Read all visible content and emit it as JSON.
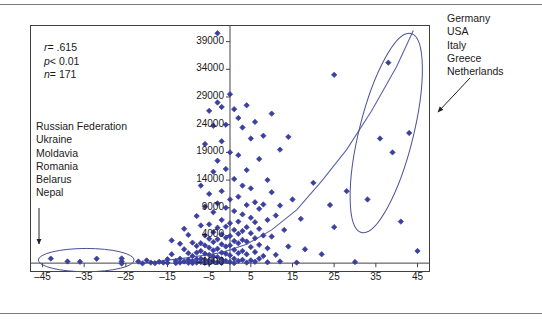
{
  "chart_data": {
    "type": "scatter",
    "title": "",
    "subtitle": "",
    "xlabel": "",
    "ylabel": "",
    "xlim": [
      -48,
      48
    ],
    "ylim": [
      -2600,
      42000
    ],
    "grid": false,
    "legend_position": "none",
    "x_ticks": [
      -45,
      -35,
      -25,
      -15,
      -5,
      5,
      15,
      25,
      35,
      45
    ],
    "y_ticks": [
      -1000,
      4000,
      9000,
      14000,
      19000,
      24000,
      29000,
      34000,
      39000
    ],
    "marker": "diamond",
    "marker_color": "#3b3f9e",
    "fit_line": {
      "type": "exponential-curve",
      "color": "#5a63ae",
      "points": [
        [
          -22,
          -1100
        ],
        [
          -10,
          0
        ],
        [
          -2,
          900
        ],
        [
          4,
          2400
        ],
        [
          10,
          5000
        ],
        [
          16,
          8600
        ],
        [
          22,
          13800
        ],
        [
          28,
          19500
        ],
        [
          34,
          26500
        ],
        [
          40,
          34500
        ],
        [
          44,
          41000
        ]
      ]
    },
    "series": [
      {
        "name": "countries",
        "points": [
          [
            -43,
            -180
          ],
          [
            -39,
            -700
          ],
          [
            -36,
            -760
          ],
          [
            -32,
            -200
          ],
          [
            -26,
            -150
          ],
          [
            -26,
            -680
          ],
          [
            -26,
            -1060
          ],
          [
            -22,
            -700
          ],
          [
            -21,
            -1050
          ],
          [
            -20,
            -500
          ],
          [
            -19,
            -900
          ],
          [
            -18,
            -1000
          ],
          [
            -17,
            -760
          ],
          [
            -16,
            -900
          ],
          [
            -15,
            -950
          ],
          [
            -15,
            -300
          ],
          [
            -14,
            3100
          ],
          [
            -14,
            600
          ],
          [
            -13,
            -600
          ],
          [
            -13,
            -1000
          ],
          [
            -12,
            2500
          ],
          [
            -12,
            -200
          ],
          [
            -12,
            -900
          ],
          [
            -11,
            5200
          ],
          [
            -11,
            1500
          ],
          [
            -11,
            -700
          ],
          [
            -10,
            4100
          ],
          [
            -10,
            800
          ],
          [
            -10,
            -400
          ],
          [
            -10,
            -950
          ],
          [
            -9,
            2700
          ],
          [
            -9,
            300
          ],
          [
            -9,
            -600
          ],
          [
            -9,
            -1000
          ],
          [
            -8,
            7500
          ],
          [
            -8,
            2100
          ],
          [
            -8,
            900
          ],
          [
            -8,
            -300
          ],
          [
            -8,
            -900
          ],
          [
            -7,
            13000
          ],
          [
            -7,
            5800
          ],
          [
            -7,
            2600
          ],
          [
            -7,
            1200
          ],
          [
            -7,
            -200
          ],
          [
            -7,
            -800
          ],
          [
            -6,
            20500
          ],
          [
            -6,
            9200
          ],
          [
            -6,
            4000
          ],
          [
            -6,
            2200
          ],
          [
            -6,
            700
          ],
          [
            -6,
            -400
          ],
          [
            -6,
            -950
          ],
          [
            -5,
            26500
          ],
          [
            -5,
            11500
          ],
          [
            -5,
            6000
          ],
          [
            -5,
            3400
          ],
          [
            -5,
            1800
          ],
          [
            -5,
            500
          ],
          [
            -5,
            -500
          ],
          [
            -5,
            -1000
          ],
          [
            -4,
            23800
          ],
          [
            -4,
            15500
          ],
          [
            -4,
            8200
          ],
          [
            -4,
            4600
          ],
          [
            -4,
            2800
          ],
          [
            -4,
            1300
          ],
          [
            -4,
            200
          ],
          [
            -4,
            -700
          ],
          [
            -3,
            40500
          ],
          [
            -3,
            28000
          ],
          [
            -3,
            17500
          ],
          [
            -3,
            9800
          ],
          [
            -3,
            5400
          ],
          [
            -3,
            3300
          ],
          [
            -3,
            1600
          ],
          [
            -3,
            100
          ],
          [
            -3,
            -850
          ],
          [
            -2,
            27200
          ],
          [
            -2,
            21000
          ],
          [
            -2,
            12000
          ],
          [
            -2,
            6800
          ],
          [
            -2,
            4200
          ],
          [
            -2,
            2400
          ],
          [
            -2,
            900
          ],
          [
            -2,
            -300
          ],
          [
            -2,
            -950
          ],
          [
            -1,
            24000
          ],
          [
            -1,
            16000
          ],
          [
            -1,
            9000
          ],
          [
            -1,
            5600
          ],
          [
            -1,
            3600
          ],
          [
            -1,
            2000
          ],
          [
            -1,
            700
          ],
          [
            -1,
            -600
          ],
          [
            0,
            29500
          ],
          [
            0,
            19000
          ],
          [
            0,
            10500
          ],
          [
            0,
            6200
          ],
          [
            0,
            3900
          ],
          [
            0,
            2200
          ],
          [
            0,
            400
          ],
          [
            0,
            -800
          ],
          [
            1,
            26800
          ],
          [
            1,
            14200
          ],
          [
            1,
            8400
          ],
          [
            1,
            5000
          ],
          [
            1,
            3000
          ],
          [
            1,
            1400
          ],
          [
            1,
            -200
          ],
          [
            1,
            -1000
          ],
          [
            2,
            25200
          ],
          [
            2,
            18500
          ],
          [
            2,
            11000
          ],
          [
            2,
            6500
          ],
          [
            2,
            4300
          ],
          [
            2,
            2600
          ],
          [
            2,
            800
          ],
          [
            2,
            -600
          ],
          [
            3,
            23500
          ],
          [
            3,
            13000
          ],
          [
            3,
            7800
          ],
          [
            3,
            4800
          ],
          [
            3,
            3200
          ],
          [
            3,
            1200
          ],
          [
            3,
            -400
          ],
          [
            4,
            27500
          ],
          [
            4,
            15800
          ],
          [
            4,
            9500
          ],
          [
            4,
            5500
          ],
          [
            4,
            2900
          ],
          [
            4,
            600
          ],
          [
            4,
            -900
          ],
          [
            5,
            21500
          ],
          [
            5,
            12500
          ],
          [
            5,
            7200
          ],
          [
            5,
            4400
          ],
          [
            5,
            1900
          ],
          [
            5,
            -500
          ],
          [
            6,
            24500
          ],
          [
            6,
            10000
          ],
          [
            6,
            6400
          ],
          [
            6,
            3500
          ],
          [
            6,
            1000
          ],
          [
            6,
            -750
          ],
          [
            7,
            17800
          ],
          [
            7,
            8800
          ],
          [
            7,
            5200
          ],
          [
            7,
            2300
          ],
          [
            7,
            -200
          ],
          [
            8,
            22000
          ],
          [
            8,
            9600
          ],
          [
            8,
            4000
          ],
          [
            8,
            300
          ],
          [
            9,
            14000
          ],
          [
            9,
            6800
          ],
          [
            9,
            1700
          ],
          [
            9,
            -850
          ],
          [
            10,
            26000
          ],
          [
            10,
            11800
          ],
          [
            10,
            3800
          ],
          [
            11,
            7600
          ],
          [
            11,
            500
          ],
          [
            12,
            19500
          ],
          [
            12,
            9400
          ],
          [
            12,
            -700
          ],
          [
            13,
            5000
          ],
          [
            14,
            21800
          ],
          [
            14,
            2000
          ],
          [
            15,
            10500
          ],
          [
            16,
            -900
          ],
          [
            17,
            7000
          ],
          [
            18,
            1500
          ],
          [
            20,
            13500
          ],
          [
            22,
            600
          ],
          [
            24,
            9500
          ],
          [
            25,
            33000
          ],
          [
            25,
            5500
          ],
          [
            28,
            12000
          ],
          [
            30,
            -800
          ],
          [
            33,
            10500
          ],
          [
            36,
            21500
          ],
          [
            38,
            35200
          ],
          [
            39,
            19000
          ],
          [
            41,
            6500
          ],
          [
            43,
            22500
          ],
          [
            45,
            1200
          ]
        ]
      }
    ],
    "annotations": [
      {
        "name": "stats",
        "lines": [
          {
            "symbol": "r",
            "relation": "=",
            "value": ".615"
          },
          {
            "symbol": "p",
            "relation": "<",
            "value": "0.01"
          },
          {
            "symbol": "n",
            "relation": "=",
            "value": "171"
          }
        ]
      },
      {
        "name": "low-outliers",
        "labels": [
          "Russian Federation",
          "Ukraine",
          "Moldavia",
          "Romania",
          "Belarus",
          "Nepal"
        ],
        "target": "left-ellipse"
      },
      {
        "name": "high-outliers",
        "labels": [
          "Germany",
          "USA",
          "Italy",
          "Greece",
          "Netherlands"
        ],
        "target": "right-ellipse"
      }
    ],
    "ellipses": [
      {
        "name": "left-ellipse",
        "cx": -34.5,
        "cy": -450,
        "rx": 11.5,
        "ry": 2100,
        "rotation": 0
      },
      {
        "name": "right-ellipse",
        "cx": 37.5,
        "cy": 22500,
        "rx": 6.5,
        "ry": 18500,
        "rotation": 14
      }
    ]
  },
  "stats": {
    "r_symbol": "r",
    "r_rel": "= ",
    "r_value": ".615",
    "p_symbol": "p",
    "p_rel": "< ",
    "p_value": "0.01",
    "n_symbol": "n",
    "n_rel": "= ",
    "n_value": "171"
  },
  "annot_left": {
    "line1": "Russian Federation",
    "line2": "Ukraine",
    "line3": "Moldavia",
    "line4": "Romania",
    "line5": "Belarus",
    "line6": "Nepal"
  },
  "annot_right": {
    "line1": "Germany",
    "line2": "USA",
    "line3": "Italy",
    "line4": "Greece",
    "line5": "Netherlands"
  },
  "axis": {
    "y_labels": [
      "39000",
      "34000",
      "29000",
      "24000",
      "19000",
      "14000",
      "9000",
      "4000",
      "–1000"
    ],
    "x_labels": [
      "–45",
      "–35",
      "–25",
      "–15",
      "–5",
      "5",
      "15",
      "25",
      "35",
      "45"
    ]
  },
  "colors": {
    "marker": "#3b3f9e",
    "curve": "#5a63ae",
    "ellipse": "#4a4f96",
    "frame": "#3f3f3f",
    "rule": "#7a7a7a",
    "arrow": "#222222"
  }
}
